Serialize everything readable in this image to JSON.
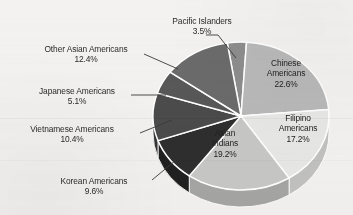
{
  "chart_data": {
    "type": "pie",
    "title": "",
    "subtitle": "",
    "xlabel": "",
    "ylabel": "",
    "legend_position": "none",
    "grid": false,
    "three_d": true,
    "value_unit": "%",
    "total": 100.0,
    "categories": [
      "Pacific Islanders",
      "Chinese Americans",
      "Filipino Americans",
      "Asian Indians",
      "Korean Americans",
      "Vietnamese Americans",
      "Japanese Americans",
      "Other Asian Americans"
    ],
    "values": [
      3.5,
      22.6,
      17.2,
      19.2,
      9.6,
      10.4,
      5.1,
      12.4
    ],
    "slices": [
      {
        "name": "Pacific Islanders",
        "label": "Pacific Islanders",
        "value": 3.5,
        "value_text": "3.5%",
        "color": "#8d8d8d",
        "side_color": "#6f6f6f",
        "label_placement": "outside-leader"
      },
      {
        "name": "Chinese Americans",
        "label_line1": "Chinese",
        "label_line2": "Americans",
        "value": 22.6,
        "value_text": "22.6%",
        "color": "#b9b9b9",
        "side_color": "#9a9a9a",
        "label_placement": "inside"
      },
      {
        "name": "Filipino Americans",
        "label_line1": "Filipino",
        "label_line2": "Americans",
        "value": 17.2,
        "value_text": "17.2%",
        "color": "#e8e8e6",
        "side_color": "#c2c2c0",
        "label_placement": "inside"
      },
      {
        "name": "Asian Indians",
        "label_line1": "Asian",
        "label_line2": "Indians",
        "value": 19.2,
        "value_text": "19.2%",
        "color": "#c8c8c6",
        "side_color": "#a6a6a4",
        "label_placement": "inside"
      },
      {
        "name": "Korean Americans",
        "label": "Korean Americans",
        "value": 9.6,
        "value_text": "9.6%",
        "color": "#2e2e2e",
        "side_color": "#202020",
        "label_placement": "outside-leader"
      },
      {
        "name": "Vietnamese Americans",
        "label": "Vietnamese Americans",
        "value": 10.4,
        "value_text": "10.4%",
        "color": "#4b4b4b",
        "side_color": "#363636",
        "label_placement": "outside-leader"
      },
      {
        "name": "Japanese Americans",
        "label": "Japanese Americans",
        "value": 5.1,
        "value_text": "5.1%",
        "color": "#585858",
        "side_color": "#414141",
        "label_placement": "outside-leader"
      },
      {
        "name": "Other Asian Americans",
        "label": "Other Asian Americans",
        "value": 12.4,
        "value_text": "12.4%",
        "color": "#6b6b6b",
        "side_color": "#525252",
        "label_placement": "outside-leader"
      }
    ],
    "background_color": "#f3f2f0",
    "text_color": "#2b2b2b",
    "slice_border_color": "#ffffff"
  },
  "labels": {
    "pacific_islanders": {
      "name": "Pacific Islanders",
      "pct": "3.5%"
    },
    "other_asian": {
      "name": "Other Asian Americans",
      "pct": "12.4%"
    },
    "japanese": {
      "name": "Japanese Americans",
      "pct": "5.1%"
    },
    "vietnamese": {
      "name": "Vietnamese Americans",
      "pct": "10.4%"
    },
    "korean": {
      "name": "Korean Americans",
      "pct": "9.6%"
    },
    "chinese": {
      "l1": "Chinese",
      "l2": "Americans",
      "pct": "22.6%"
    },
    "filipino": {
      "l1": "Filipino",
      "l2": "Americans",
      "pct": "17.2%"
    },
    "asian_indians": {
      "l1": "Asian",
      "l2": "Indians",
      "pct": "19.2%"
    }
  }
}
